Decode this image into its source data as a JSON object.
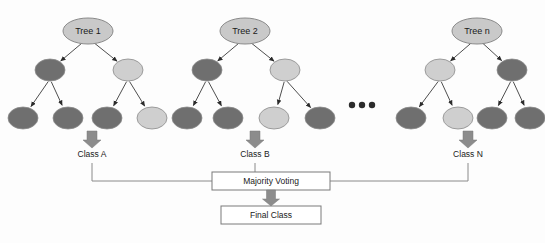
{
  "diagram": {
    "colors": {
      "root_fill": "#c9c9c9",
      "node_dark": "#6f6f6f",
      "node_light": "#cfcfcf",
      "node_stroke": "#8a8a8a",
      "edge": "#3a3a3a",
      "arrow_gray": "#8c8c8c",
      "box_stroke": "#7a7a7a",
      "box_fill": "#ffffff",
      "connector": "#8a8a8a",
      "text": "#1a1a1a",
      "background": "#fdfdfd"
    },
    "trees": [
      {
        "id": "tree-1",
        "root_label": "Tree 1",
        "root_cx": 88,
        "root_cy": 31,
        "internal": [
          {
            "cx": 50,
            "cy": 70,
            "shade": "dark"
          },
          {
            "cx": 128,
            "cy": 70,
            "shade": "light"
          }
        ],
        "leaves": [
          {
            "cx": 23,
            "cy": 118,
            "shade": "dark"
          },
          {
            "cx": 68,
            "cy": 118,
            "shade": "dark"
          },
          {
            "cx": 107,
            "cy": 118,
            "shade": "dark"
          },
          {
            "cx": 152,
            "cy": 118,
            "shade": "light"
          }
        ],
        "output_label": "Class   A",
        "output_cx": 92,
        "arrow_cx": 92
      },
      {
        "id": "tree-2",
        "root_label": "Tree 2",
        "root_cx": 245,
        "root_cy": 31,
        "internal": [
          {
            "cx": 207,
            "cy": 70,
            "shade": "dark"
          },
          {
            "cx": 285,
            "cy": 70,
            "shade": "light"
          }
        ],
        "leaves": [
          {
            "cx": 187,
            "cy": 118,
            "shade": "dark"
          },
          {
            "cx": 228,
            "cy": 118,
            "shade": "dark"
          },
          {
            "cx": 274,
            "cy": 118,
            "shade": "light"
          },
          {
            "cx": 320,
            "cy": 118,
            "shade": "dark"
          }
        ],
        "output_label": "Class B",
        "output_cx": 255,
        "arrow_cx": 255
      },
      {
        "id": "tree-n",
        "root_label": "Tree n",
        "root_cx": 477,
        "root_cy": 31,
        "internal": [
          {
            "cx": 440,
            "cy": 70,
            "shade": "light"
          },
          {
            "cx": 512,
            "cy": 70,
            "shade": "dark"
          }
        ],
        "leaves": [
          {
            "cx": 411,
            "cy": 118,
            "shade": "dark"
          },
          {
            "cx": 458,
            "cy": 118,
            "shade": "light"
          },
          {
            "cx": 492,
            "cy": 118,
            "shade": "dark"
          },
          {
            "cx": 530,
            "cy": 118,
            "shade": "dark"
          }
        ],
        "output_label": "Class N",
        "output_cx": 468,
        "arrow_cx": 468
      }
    ],
    "ellipsis": [
      {
        "cx": 352,
        "cy": 105
      },
      {
        "cx": 362,
        "cy": 105
      },
      {
        "cx": 372,
        "cy": 105
      }
    ],
    "boxes": {
      "majority_voting": {
        "label": "Majority Voting",
        "x": 212,
        "y": 172,
        "width": 118,
        "height": 18
      },
      "final_class": {
        "label": "Final Class",
        "x": 221,
        "y": 206,
        "width": 100,
        "height": 18
      }
    },
    "output_labels_y": 157,
    "connector_y": 181
  }
}
